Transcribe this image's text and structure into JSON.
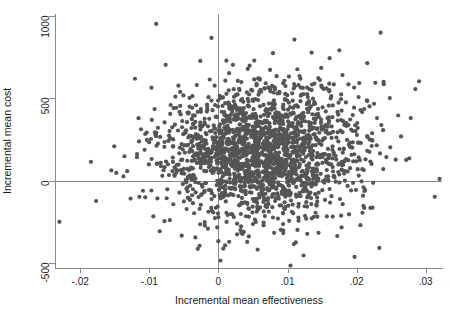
{
  "chart_data": {
    "type": "scatter",
    "title": "",
    "xlabel": "Incremental mean effectiveness",
    "ylabel": "Incremental mean cost",
    "xlim": [
      -0.0235,
      0.0325
    ],
    "ylim": [
      -530,
      1010
    ],
    "xticks": [
      -0.02,
      -0.01,
      0,
      0.01,
      0.02,
      0.03
    ],
    "xticklabels": [
      "-.02",
      "-.01",
      "0",
      ".01",
      ".02",
      ".03"
    ],
    "yticks": [
      -500,
      0,
      500,
      1000
    ],
    "yticklabels": [
      "-500",
      "0",
      "500",
      "1000"
    ],
    "grid": false,
    "legend": null,
    "reference_lines": [
      {
        "axis": "y",
        "value": 0,
        "color": "#8a8a8a"
      },
      {
        "axis": "x",
        "value": 0,
        "color": "#8a8a8a"
      }
    ],
    "marker": {
      "color": "#555555",
      "size_px": 4.2,
      "shape": "circle",
      "opacity": 1
    },
    "n_points": 2000,
    "distribution": {
      "description": "Cost-effectiveness plane bootstrap cloud, dense ellipse centred on positive effectiveness and positive cost",
      "x_mean": 0.0065,
      "x_sd": 0.0072,
      "y_mean": 175,
      "y_sd": 205,
      "correlation": 0.06
    },
    "notable_points": [
      {
        "x": -0.009,
        "y": 950
      },
      {
        "x": -0.001,
        "y": 865
      },
      {
        "x": 0.011,
        "y": 855
      },
      {
        "x": 0.0175,
        "y": 790
      },
      {
        "x": -0.023,
        "y": -250
      },
      {
        "x": 0.0003,
        "y": -485
      },
      {
        "x": 0.0112,
        "y": -375
      },
      {
        "x": 0.032,
        "y": 10
      },
      {
        "x": 0.0285,
        "y": 555
      },
      {
        "x": 0.0248,
        "y": 500
      }
    ]
  },
  "axis": {
    "x_title": "Incremental mean effectiveness",
    "y_title": "Incremental mean cost"
  }
}
